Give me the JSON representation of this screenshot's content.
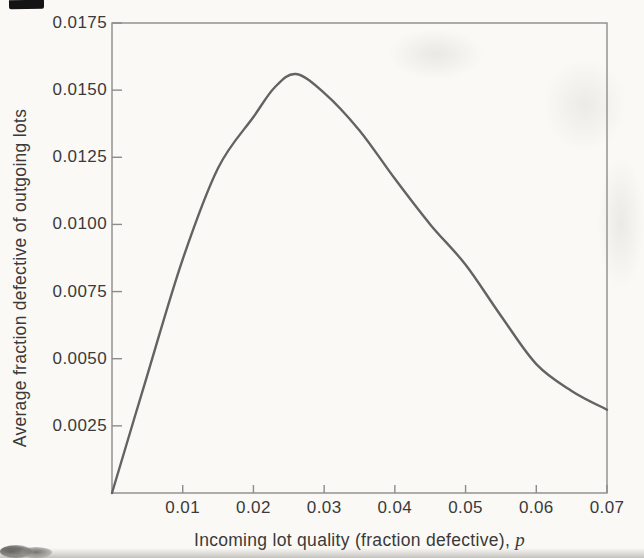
{
  "figure": {
    "background_color": "#faf9f6",
    "text_color": "#3a3a3a",
    "axis_color": "#8c8c8a",
    "curve_color": "#636363"
  },
  "chart_data": {
    "type": "line",
    "title": "",
    "xlabel": "Incoming lot quality (fraction defective), p",
    "xlabel_main": "Incoming lot quality (fraction defective), ",
    "xlabel_var": "p",
    "ylabel": "Average fraction defective of outgoing lots",
    "xlim": [
      0,
      0.07
    ],
    "ylim": [
      0,
      0.0175
    ],
    "x_ticks": [
      0.01,
      0.02,
      0.03,
      0.04,
      0.05,
      0.06,
      0.07
    ],
    "x_tick_labels": [
      "0.01",
      "0.02",
      "0.03",
      "0.04",
      "0.05",
      "0.06",
      "0.07"
    ],
    "y_ticks": [
      0.0025,
      0.005,
      0.0075,
      0.01,
      0.0125,
      0.015,
      0.0175
    ],
    "y_tick_labels": [
      "0.0025",
      "0.0050",
      "0.0075",
      "0.0100",
      "0.0125",
      "0.0150",
      "0.0175"
    ],
    "grid": false,
    "legend": null,
    "series": [
      {
        "name": "average-outgoing-quality-curve",
        "x": [
          0,
          0.005,
          0.01,
          0.015,
          0.02,
          0.023,
          0.026,
          0.03,
          0.035,
          0.04,
          0.045,
          0.05,
          0.055,
          0.06,
          0.065,
          0.07
        ],
        "y": [
          0,
          0.0044,
          0.0087,
          0.0121,
          0.014,
          0.0151,
          0.0156,
          0.0149,
          0.0135,
          0.0117,
          0.01,
          0.0085,
          0.0066,
          0.0048,
          0.0038,
          0.0031
        ]
      }
    ],
    "peak": {
      "x": 0.026,
      "y": 0.0156
    }
  }
}
